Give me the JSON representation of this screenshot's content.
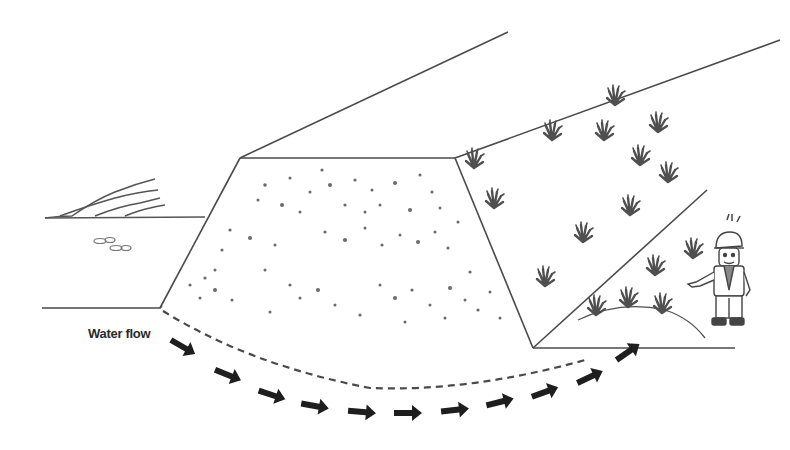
{
  "diagram": {
    "type": "embankment-seepage-illustration",
    "labels": {
      "water_flow": "Water flow"
    },
    "elements": {
      "reservoir": "water-waves-left",
      "embankment_crest": "embankment-top-surface",
      "upstream_face": "dotted-rock-face",
      "downstream_slope": "vegetated-slope",
      "seepage_path": "dashed-curve",
      "flow_arrows_count": 14,
      "inspector": "worker-with-hardhat-pointing"
    },
    "colors": {
      "line": "#4a4a4a",
      "arrow": "#1e1e1e",
      "dots": "#6a6a6a",
      "plants": "#4f4f4f",
      "background": "#ffffff"
    }
  }
}
